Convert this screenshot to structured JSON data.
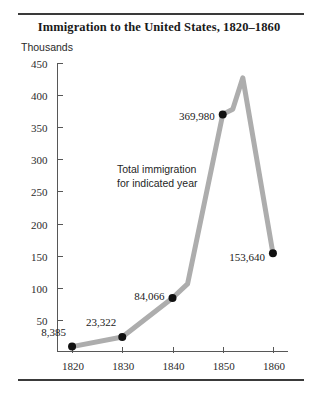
{
  "chart_data": {
    "type": "line",
    "title": "Immigration to the United States, 1820–1860",
    "xlabel": "",
    "ylabel": "Thousands",
    "x": [
      1820,
      1830,
      1840,
      1850,
      1860
    ],
    "categories": [
      "1820",
      "1830",
      "1840",
      "1850",
      "1860"
    ],
    "values": [
      8.385,
      23.322,
      84.066,
      369.98,
      153.64
    ],
    "point_labels": [
      "8,385",
      "23,322",
      "84,066",
      "369,980",
      "153,640"
    ],
    "xtick_labels": [
      "1820",
      "1830",
      "1840",
      "1850",
      "1860"
    ],
    "ytick_labels": [
      "450",
      "400",
      "350",
      "300",
      "250",
      "200",
      "150",
      "100",
      "50"
    ],
    "ytick_values": [
      450,
      400,
      350,
      300,
      250,
      200,
      150,
      100,
      50
    ],
    "xlim": [
      1817,
      1863
    ],
    "ylim": [
      0,
      450
    ],
    "grid": false,
    "legend": false,
    "annotation": "Total immigration\nfor indicated year",
    "annotation_line1": "Total immigration",
    "annotation_line2": "for indicated year",
    "vertices": [
      {
        "x": 1820,
        "y": 8.385
      },
      {
        "x": 1830,
        "y": 23.322
      },
      {
        "x": 1840,
        "y": 84.066
      },
      {
        "x": 1843,
        "y": 106
      },
      {
        "x": 1850,
        "y": 369.98
      },
      {
        "x": 1852,
        "y": 378
      },
      {
        "x": 1854,
        "y": 427
      },
      {
        "x": 1860,
        "y": 153.64
      }
    ],
    "line_color": "#adadad",
    "marker_color": "#111111",
    "axis_color": "#575757",
    "rule_color": "#3a3a3a",
    "background": "#ffffff"
  }
}
